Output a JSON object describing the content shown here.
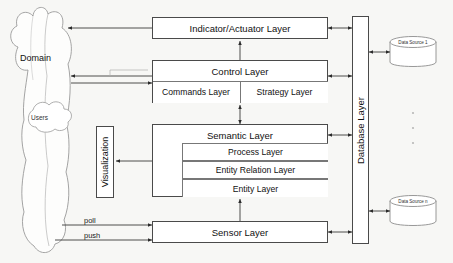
{
  "diagram": {
    "background_color": "#f7f7f5",
    "line_color": "#4a4a4a",
    "box_fill": "#ffffff"
  },
  "domain": {
    "cloud_label": "Domain",
    "users_label": "Users"
  },
  "layers": {
    "indicator_actuator": "Indicator/Actuator Layer",
    "control": "Control Layer",
    "commands": "Commands Layer",
    "strategy": "Strategy Layer",
    "semantic": "Semantic Layer",
    "process": "Process Layer",
    "entity_relation": "Entity Relation Layer",
    "entity": "Entity Layer",
    "sensor": "Sensor Layer",
    "visualization": "Visualization",
    "database": "Database Layer"
  },
  "edges": {
    "poll": "poll",
    "push": "push"
  },
  "data_sources": {
    "first": "Data Source 1",
    "last": "Data Source n",
    "ellipsis": "⋮"
  }
}
